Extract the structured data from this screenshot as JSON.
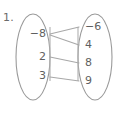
{
  "problem": {
    "number_label": "1."
  },
  "diagram": {
    "type": "mapping-diagram",
    "stroke_color": "#9a9a9a",
    "line_color": "#a8a8a8",
    "text_color": "#5f5f5f",
    "background_color": "#ffffff",
    "domain_oval": {
      "name": "domain",
      "cx": 33,
      "cy": 57,
      "rx": 17,
      "ry": 43,
      "elements": [
        {
          "label": "-8",
          "x": 46,
          "y": 34
        },
        {
          "label": "2",
          "x": 46,
          "y": 57
        },
        {
          "label": "3",
          "x": 46,
          "y": 76
        }
      ]
    },
    "range_oval": {
      "name": "range",
      "cx": 95,
      "cy": 57,
      "rx": 17,
      "ry": 43,
      "elements": [
        {
          "label": "-6",
          "x": 85,
          "y": 27
        },
        {
          "label": "4",
          "x": 85,
          "y": 45
        },
        {
          "label": "8",
          "x": 85,
          "y": 63
        },
        {
          "label": "9",
          "x": 85,
          "y": 81
        }
      ]
    },
    "edge_ticks": [
      {
        "x": 50,
        "y1": 27,
        "y2": 81
      },
      {
        "x": 78,
        "y1": 27,
        "y2": 81
      }
    ],
    "mappings": [
      {
        "from": "-8",
        "to": "-6",
        "x1": 50,
        "y1": 34,
        "x2": 79,
        "y2": 27
      },
      {
        "from": "-8",
        "to": "4",
        "x1": 50,
        "y1": 35,
        "x2": 79,
        "y2": 45
      },
      {
        "from": "2",
        "to": "8",
        "x1": 50,
        "y1": 57,
        "x2": 79,
        "y2": 63
      },
      {
        "from": "3",
        "to": "9",
        "x1": 50,
        "y1": 77,
        "x2": 79,
        "y2": 81
      }
    ]
  }
}
